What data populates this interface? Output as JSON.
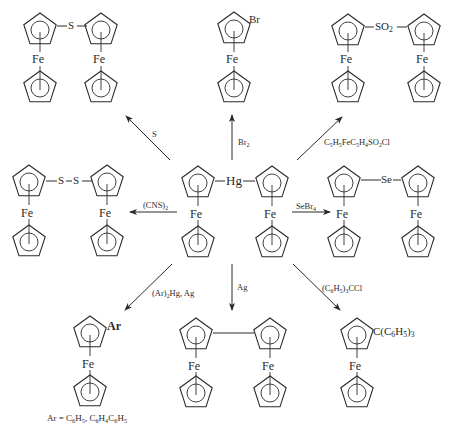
{
  "diagram": {
    "type": "reaction-scheme",
    "center_compound": {
      "name": "diferrocenylmercury",
      "bridge_label": "Hg",
      "metal_label": "Fe"
    },
    "reactions": [
      {
        "id": "sulfur",
        "reagent": "S",
        "direction": "up-left",
        "product": "diferrocenyl sulfide",
        "bridge_label": "S"
      },
      {
        "id": "bromine",
        "reagent_main": "Br",
        "reagent_sub": "2",
        "direction": "up",
        "product": "bromoferrocene",
        "substituent_label": "Br"
      },
      {
        "id": "sulfonyl",
        "reagent": "C5H5FeC5H4SO2Cl",
        "direction": "up-right",
        "product": "diferrocenyl sulfone",
        "bridge_label": "SO2"
      },
      {
        "id": "thiocyanogen",
        "reagent_main": "(CNS)",
        "reagent_sub": "2",
        "direction": "left",
        "product": "diferrocenyl disulfide",
        "bridge_label": "S–S"
      },
      {
        "id": "selenium",
        "reagent_main": "SeBr",
        "reagent_sub": "4",
        "direction": "right",
        "product": "diferrocenyl selenide",
        "bridge_label": "Se"
      },
      {
        "id": "aryl",
        "reagent": "(Ar)2Hg, Ag",
        "direction": "down-left",
        "product": "arylferrocene",
        "substituent_label": "Ar"
      },
      {
        "id": "silver",
        "reagent": "Ag",
        "direction": "down",
        "product": "biferrocenyl"
      },
      {
        "id": "trityl",
        "reagent": "(C6H5)3CCl",
        "direction": "down-right",
        "product": "tritylferrocene",
        "substituent_label": "C(C6H5)3"
      }
    ],
    "footnote": "Ar = C6H5, C6H4C6H5"
  },
  "labels": {
    "fe": "Fe",
    "s": "S",
    "br": "Br",
    "so2_main": "SO",
    "so2_sub": "2",
    "ss": "S–S",
    "hg": "Hg",
    "se": "Se",
    "ar": "Ar",
    "trityl_pre": "C(C",
    "trityl_sub1": "6",
    "trityl_mid": "H",
    "trityl_sub2": "5",
    "trityl_post": ")",
    "trityl_sub3": "3"
  },
  "reagents": {
    "s": "S",
    "br2_main": "Br",
    "br2_sub": "2",
    "sulfonyl": [
      "C",
      "5",
      "H",
      "5",
      "FeC",
      "5",
      "H",
      "4",
      "SO",
      "2",
      "Cl"
    ],
    "cns_main": "(CNS)",
    "cns_sub": "2",
    "sebr4_main": "SeBr",
    "sebr4_sub": "4",
    "arhg": [
      "(Ar)",
      "2",
      "Hg, Ag"
    ],
    "ag": "Ag",
    "trityl": [
      "(C",
      "6",
      "H",
      "5",
      ")",
      "3",
      "CCl"
    ]
  },
  "footnote": [
    "Ar = C",
    "6",
    "H",
    "5",
    ", C",
    "6",
    "H",
    "4",
    "C",
    "6",
    "H",
    "5"
  ],
  "colors": {
    "ink": "#2a2a2a",
    "background": "#ffffff"
  }
}
